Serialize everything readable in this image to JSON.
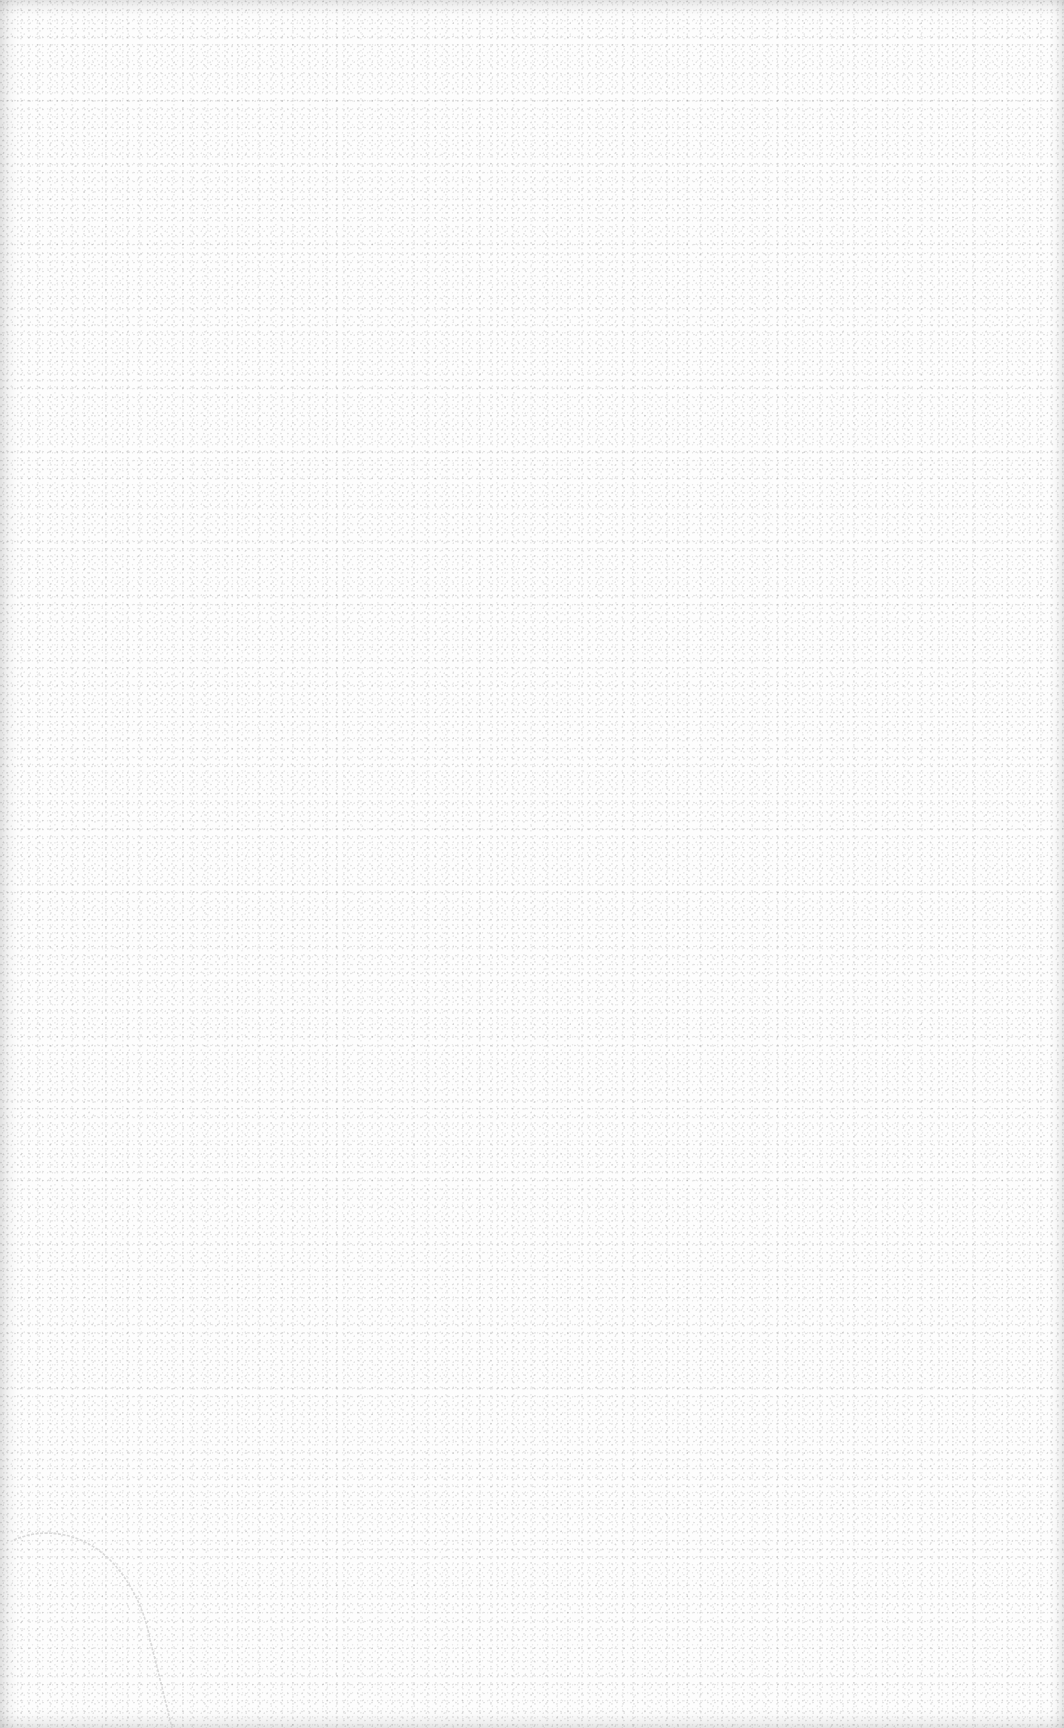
{
  "page": {
    "content_text": "",
    "background_color": "#fdfdfd",
    "texture": "speckled-paper-grain",
    "features": [
      {
        "type": "crease",
        "position": "bottom-left",
        "color": "#cfcfcf"
      }
    ]
  }
}
